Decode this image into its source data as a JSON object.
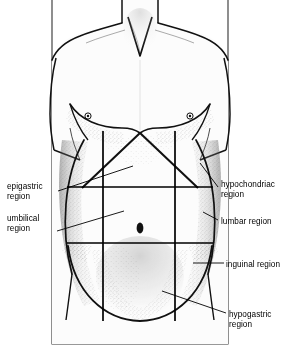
{
  "figure": {
    "line_color": "#000000",
    "skin_fill": "#fbfbfb",
    "shading_color": "#4a4a4a",
    "background": "#ffffff"
  },
  "labels": [
    {
      "key": "epigastric",
      "text": "epigastric\nregion",
      "side": "left",
      "x": 7,
      "y": 182,
      "leader": {
        "x1": 58,
        "y1": 191,
        "x2": 133,
        "y2": 166
      }
    },
    {
      "key": "umbilical",
      "text": "umbilical\nregion",
      "side": "left",
      "x": 7,
      "y": 214,
      "leader": {
        "x1": 57,
        "y1": 231,
        "x2": 124,
        "y2": 211
      }
    },
    {
      "key": "hypochondriac",
      "text": "hypochondriac\nregion",
      "side": "right",
      "x": 221,
      "y": 180,
      "leader": {
        "x1": 218,
        "y1": 187,
        "x2": 200,
        "y2": 163
      }
    },
    {
      "key": "lumbar",
      "text": "lumbar region",
      "side": "right",
      "x": 221,
      "y": 217,
      "leader": {
        "x1": 218,
        "y1": 220,
        "x2": 203,
        "y2": 212
      }
    },
    {
      "key": "inguinal",
      "text": "inguinal region",
      "side": "right",
      "x": 226,
      "y": 260,
      "leader": {
        "x1": 224,
        "y1": 263,
        "x2": 193,
        "y2": 263
      }
    },
    {
      "key": "hypogastric",
      "text": "hypogastric\nregion",
      "side": "right",
      "x": 229,
      "y": 310,
      "leader": {
        "x1": 226,
        "y1": 313,
        "x2": 162,
        "y2": 291
      }
    }
  ],
  "anatomy": {
    "grid": {
      "vertical_left_x": 103,
      "vertical_right_x": 175,
      "vertical_top_y": 131,
      "vertical_bottom_y": 321,
      "horizontal_upper_y": 187,
      "horizontal_lower_y": 243,
      "horizontal_left_x": 67,
      "horizontal_right_x": 213
    },
    "navel": {
      "x": 140,
      "y": 228,
      "rx": 3.4,
      "ry": 5.2
    },
    "nipples": [
      {
        "x": 88,
        "y": 116,
        "r": 3.0
      },
      {
        "x": 190,
        "y": 116,
        "r": 3.0
      }
    ],
    "costal_margin_apex": {
      "x": 140,
      "y": 133
    },
    "frame": {
      "x": 52,
      "y": 0,
      "width": 176,
      "height": 344
    }
  }
}
